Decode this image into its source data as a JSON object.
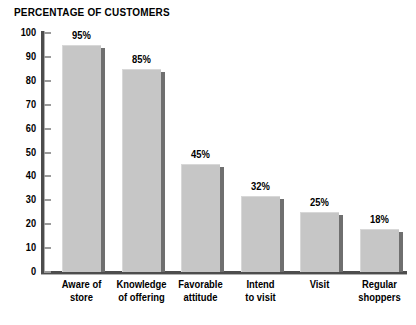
{
  "chart_data": {
    "type": "bar",
    "title": "PERCENTAGE OF CUSTOMERS",
    "xlabel": "",
    "ylabel": "",
    "ylim": [
      0,
      100
    ],
    "ytick_step": 10,
    "grid": false,
    "legend": "none",
    "categories": [
      "Aware of store",
      "Knowledge of offering",
      "Favorable attitude",
      "Intend to visit",
      "Visit",
      "Regular shoppers"
    ],
    "category_lines": [
      [
        "Aware of",
        "store"
      ],
      [
        "Knowledge",
        "of offering"
      ],
      [
        "Favorable",
        "attitude"
      ],
      [
        "Intend",
        "to visit"
      ],
      [
        "Visit"
      ],
      [
        "Regular",
        "shoppers"
      ]
    ],
    "values": [
      95,
      85,
      45,
      32,
      25,
      18
    ],
    "value_labels": [
      "95%",
      "85%",
      "45%",
      "32%",
      "25%",
      "18%"
    ],
    "ytick_labels": [
      "100",
      "90",
      "80",
      "70",
      "60",
      "50",
      "40",
      "30",
      "20",
      "10",
      "0"
    ],
    "ytick_values": [
      100,
      90,
      80,
      70,
      60,
      50,
      40,
      30,
      20,
      10,
      0
    ],
    "colors": {
      "bar_fill": "#c6c6c6",
      "bar_shadow": "#6f6f6f",
      "axis": "#4d4d4d",
      "tick": "#9a9a9a",
      "text": "#000000",
      "background": "#ffffff"
    }
  }
}
